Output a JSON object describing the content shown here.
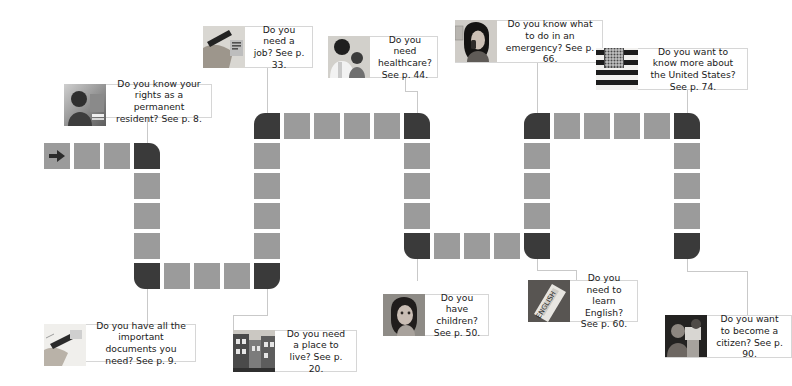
{
  "page": {
    "background_color": "#ffffff",
    "board_square_color": "#9b9b9b",
    "board_corner_color": "#3a3a3a",
    "connector_color": "#c9c9c9",
    "callout_border_color": "#d6d6d6",
    "text_color": "#1a1a1a"
  },
  "start": {
    "icon": "right-arrow-icon",
    "label": ""
  },
  "callouts": [
    {
      "id": "rights",
      "thumb_icon": "photo-man-portrait-icon",
      "lines": [
        "Do you know your rights",
        "as a permanent",
        "resident? See p. 8."
      ],
      "text": "Do you know your rights as a permanent resident? See p. 8.",
      "page": "8"
    },
    {
      "id": "documents",
      "thumb_icon": "photo-hand-writing-icon",
      "lines": [
        "Do you have all the",
        "important documents",
        "you need? See p. 9."
      ],
      "text": "Do you have all the important documents you need? See p. 9.",
      "page": "9"
    },
    {
      "id": "housing",
      "thumb_icon": "photo-city-street-icon",
      "lines": [
        "Do you need",
        "a place to live?",
        "See p. 20."
      ],
      "text": "Do you need a place to live? See p. 20.",
      "page": "20"
    },
    {
      "id": "job",
      "thumb_icon": "photo-hand-writing-form-icon",
      "lines": [
        "Do you",
        "need a job?",
        "See p. 33."
      ],
      "text": "Do you need a job? See p. 33.",
      "page": "33"
    },
    {
      "id": "healthcare",
      "thumb_icon": "photo-doctor-child-icon",
      "lines": [
        "Do you need",
        "healthcare?",
        "See p. 44."
      ],
      "text": "Do you need healthcare? See p. 44.",
      "page": "44"
    },
    {
      "id": "children",
      "thumb_icon": "photo-girl-child-icon",
      "lines": [
        "Do you have",
        "children?",
        "See p. 50."
      ],
      "text": "Do you have children? See p. 50.",
      "page": "50"
    },
    {
      "id": "english",
      "thumb_icon": "photo-english-book-icon",
      "lines": [
        "Do you need to",
        "learn English?",
        "See p. 60."
      ],
      "text": "Do you need to learn English? See p. 60.",
      "page": "60"
    },
    {
      "id": "emergency",
      "thumb_icon": "photo-woman-phone-icon",
      "lines": [
        "Do you know what to",
        "do in an emergency?",
        "See p. 66."
      ],
      "text": "Do you know what to do in an emergency? See p. 66.",
      "page": "66"
    },
    {
      "id": "united-states",
      "thumb_icon": "photo-us-flag-icon",
      "lines": [
        "Do you want to know",
        "more about the United",
        "States? See p. 74."
      ],
      "text": "Do you want to know more about the United States? See p. 74.",
      "page": "74"
    },
    {
      "id": "citizen",
      "thumb_icon": "photo-citizenship-ceremony-icon",
      "lines": [
        "Do you want to",
        "become a citizen?",
        "See p. 90."
      ],
      "text": "Do you want to become a citizen? See p. 90.",
      "page": "90"
    }
  ],
  "board": {
    "squares": [
      {
        "x": 44,
        "y": 143,
        "dark": false,
        "start": true
      },
      {
        "x": 74,
        "y": 143,
        "dark": false
      },
      {
        "x": 104,
        "y": 143,
        "dark": false
      },
      {
        "x": 134,
        "y": 143,
        "dark": true,
        "round": "tr"
      },
      {
        "x": 134,
        "y": 173,
        "dark": false
      },
      {
        "x": 134,
        "y": 203,
        "dark": false
      },
      {
        "x": 134,
        "y": 233,
        "dark": false
      },
      {
        "x": 134,
        "y": 263,
        "dark": true,
        "round": "bl"
      },
      {
        "x": 164,
        "y": 263,
        "dark": false
      },
      {
        "x": 194,
        "y": 263,
        "dark": false
      },
      {
        "x": 224,
        "y": 263,
        "dark": false
      },
      {
        "x": 254,
        "y": 263,
        "dark": true,
        "round": "br"
      },
      {
        "x": 254,
        "y": 233,
        "dark": false
      },
      {
        "x": 254,
        "y": 203,
        "dark": false
      },
      {
        "x": 254,
        "y": 173,
        "dark": false
      },
      {
        "x": 254,
        "y": 143,
        "dark": false
      },
      {
        "x": 254,
        "y": 113,
        "dark": true,
        "round": "tl"
      },
      {
        "x": 284,
        "y": 113,
        "dark": false
      },
      {
        "x": 314,
        "y": 113,
        "dark": false
      },
      {
        "x": 344,
        "y": 113,
        "dark": false
      },
      {
        "x": 374,
        "y": 113,
        "dark": false
      },
      {
        "x": 404,
        "y": 113,
        "dark": true,
        "round": "tr"
      },
      {
        "x": 404,
        "y": 143,
        "dark": false
      },
      {
        "x": 404,
        "y": 173,
        "dark": false
      },
      {
        "x": 404,
        "y": 203,
        "dark": false
      },
      {
        "x": 404,
        "y": 233,
        "dark": true,
        "round": "bl"
      },
      {
        "x": 434,
        "y": 233,
        "dark": false
      },
      {
        "x": 464,
        "y": 233,
        "dark": false
      },
      {
        "x": 494,
        "y": 233,
        "dark": false
      },
      {
        "x": 524,
        "y": 233,
        "dark": true,
        "round": "bl"
      },
      {
        "x": 524,
        "y": 203,
        "dark": false
      },
      {
        "x": 524,
        "y": 173,
        "dark": false
      },
      {
        "x": 524,
        "y": 143,
        "dark": false
      },
      {
        "x": 524,
        "y": 113,
        "dark": true,
        "round": "tl"
      },
      {
        "x": 554,
        "y": 113,
        "dark": false
      },
      {
        "x": 584,
        "y": 113,
        "dark": false
      },
      {
        "x": 614,
        "y": 113,
        "dark": false
      },
      {
        "x": 644,
        "y": 113,
        "dark": false
      },
      {
        "x": 674,
        "y": 113,
        "dark": true,
        "round": "tr"
      },
      {
        "x": 674,
        "y": 143,
        "dark": false
      },
      {
        "x": 674,
        "y": 173,
        "dark": false
      },
      {
        "x": 674,
        "y": 203,
        "dark": false
      },
      {
        "x": 674,
        "y": 233,
        "dark": true,
        "round": "br"
      }
    ]
  }
}
